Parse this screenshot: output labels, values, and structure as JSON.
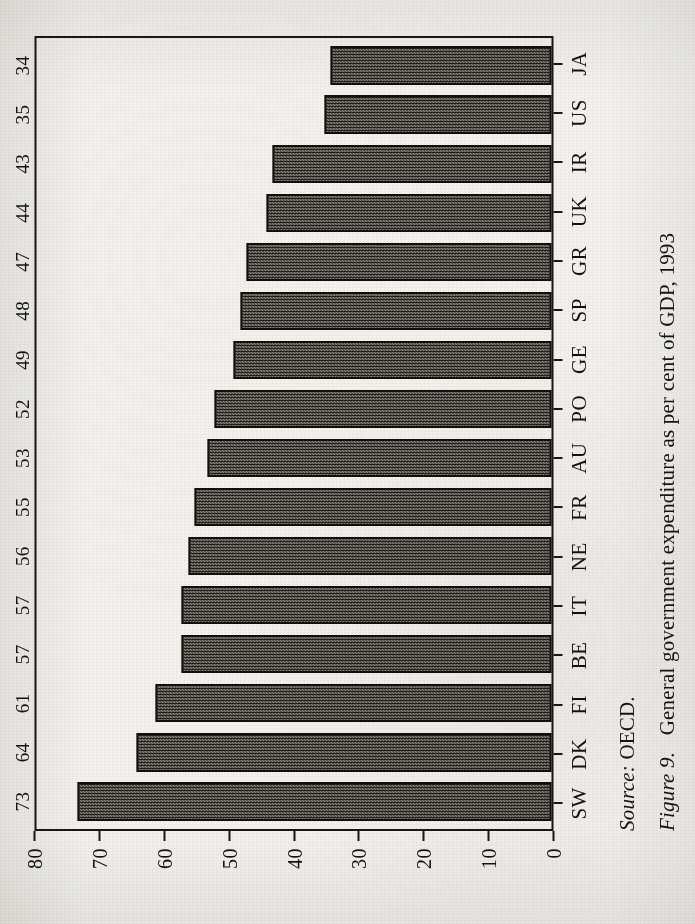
{
  "figure": {
    "label": "Figure 9.",
    "caption": "General government expenditure as per cent of GDP, 1993",
    "source_keyword": "Source:",
    "source_value": "OECD."
  },
  "chart_data": {
    "type": "bar",
    "orientation": "horizontal-printed-rotated",
    "title": "General government expenditure as per cent of GDP, 1993",
    "xlabel": "",
    "ylabel": "",
    "ylim": [
      0,
      80
    ],
    "yticks": [
      0,
      10,
      20,
      30,
      40,
      50,
      60,
      70,
      80
    ],
    "ytick_labels": [
      "0",
      "10",
      "20",
      "30",
      "40",
      "50",
      "60",
      "70",
      "80"
    ],
    "grid": false,
    "legend": false,
    "bar_value_labels": true,
    "categories": [
      "SW",
      "DK",
      "FI",
      "BE",
      "IT",
      "NE",
      "FR",
      "AU",
      "PO",
      "GE",
      "SP",
      "GR",
      "UK",
      "IR",
      "US",
      "JA"
    ],
    "values": [
      73,
      64,
      61,
      57,
      57,
      56,
      55,
      53,
      52,
      49,
      48,
      47,
      44,
      43,
      35,
      34
    ],
    "value_labels": [
      "73",
      "64",
      "61",
      "57",
      "57",
      "56",
      "55",
      "53",
      "52",
      "49",
      "48",
      "47",
      "44",
      "43",
      "35",
      "34"
    ],
    "series": [
      {
        "name": "General government expenditure (% of GDP)",
        "values": [
          73,
          64,
          61,
          57,
          57,
          56,
          55,
          53,
          52,
          49,
          48,
          47,
          44,
          43,
          35,
          34
        ]
      }
    ],
    "source": "OECD."
  },
  "colors": {
    "paper": "#f2f1ee",
    "ink": "#16140f",
    "bar_fill_dark": "#201e19",
    "bar_fill_light": "#8d8a81",
    "bar_outline": "#100f0c",
    "frame": "#191713"
  }
}
